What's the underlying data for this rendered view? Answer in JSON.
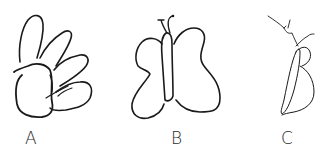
{
  "figure": {
    "panels": [
      {
        "label": "A",
        "depicts": "hand"
      },
      {
        "label": "B",
        "depicts": "butterfly"
      },
      {
        "label": "C",
        "depicts": "butterfly-side-view"
      }
    ]
  },
  "colors": {
    "stroke": "#1a1a1a",
    "background": "#ffffff",
    "label": "#2a2a2a"
  }
}
